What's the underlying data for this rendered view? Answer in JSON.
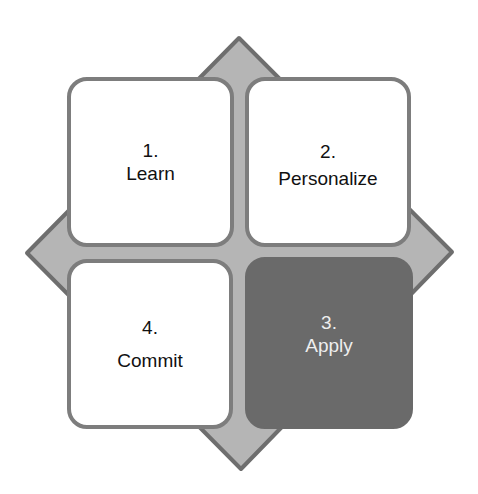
{
  "diagram": {
    "colors": {
      "diamond_fill": "#b5b5b5",
      "diamond_stroke": "#6e6e6e",
      "box_fill": "#ffffff",
      "box_border": "#7d7d7d",
      "highlight_fill": "#6a6a6a",
      "highlight_text": "#eeeeee"
    },
    "steps": [
      {
        "number": "1.",
        "label": "Learn",
        "position": "top-left",
        "highlighted": false
      },
      {
        "number": "2.",
        "label": "Personalize",
        "position": "top-right",
        "highlighted": false
      },
      {
        "number": "3.",
        "label": "Apply",
        "position": "bottom-right",
        "highlighted": true
      },
      {
        "number": "4.",
        "label": "Commit",
        "position": "bottom-left",
        "highlighted": false
      }
    ]
  }
}
